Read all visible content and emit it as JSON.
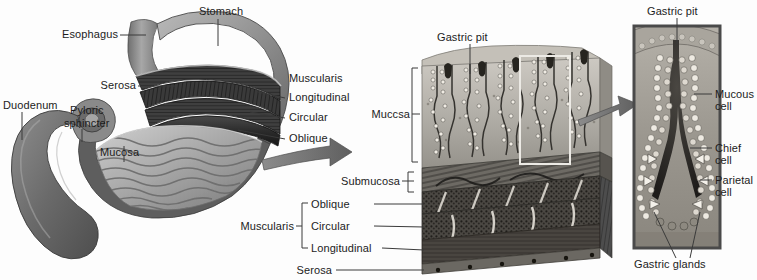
{
  "figure": {
    "background_color": "#fdfdfd",
    "text_color": "#1c1c1c",
    "leader_line_color": "#3a3a3a",
    "arrow_color": "#6e6e6e",
    "panel_border_color": "#4a4a4a",
    "highlight_box_color": "#e8e8e8"
  },
  "panels": {
    "stomach": {
      "name": "Gross stomach with cutaway",
      "labels": {
        "stomach": "Stomach",
        "esophagus": "Esophagus",
        "serosa": "Serosa",
        "muscularis": "Muscularis",
        "longitudinal": "Longitudinal",
        "circular": "Circular",
        "oblique": "Oblique",
        "duodenum": "Duodenum",
        "pyloric_sphincter_line1": "Pyloric",
        "pyloric_sphincter_line2": "sphincter",
        "mucosa": "Mucosa"
      }
    },
    "wall_block": {
      "name": "Stomach wall tissue block",
      "labels": {
        "gastric_pit": "Gastric pit",
        "mucosa": "Muccsa",
        "submucosa": "Submucosa",
        "muscularis": "Muscularis",
        "oblique": "Oblique",
        "circular": "Circular",
        "longitudinal": "Longitudinal",
        "serosa": "Serosa"
      }
    },
    "gland_detail": {
      "name": "Gastric gland magnified detail",
      "labels": {
        "gastric_pit": "Gastric pit",
        "mucous_cell_line1": "Mucous",
        "mucous_cell_line2": "cell",
        "chief_cell_line1": "Chief",
        "chief_cell_line2": "cell",
        "parietal_cell_line1": "Parietal",
        "parietal_cell_line2": "cell",
        "gastric_glands": "Gastric glands"
      }
    }
  }
}
